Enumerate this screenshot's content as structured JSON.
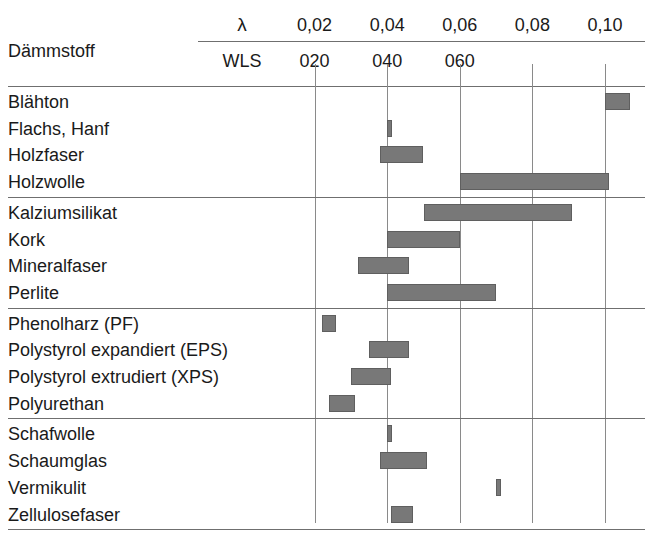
{
  "chart_data": {
    "type": "bar",
    "orientation": "horizontal",
    "title": "",
    "xlabel": "λ",
    "ylabel": "Dämmstoff",
    "row_header_label": "Dämmstoff",
    "axis_top_label": "λ",
    "axis_second_label": "WLS",
    "xlim": [
      0.0,
      0.107
    ],
    "grid": true,
    "legend": "none",
    "lambda_ticks": [
      "0,02",
      "0,04",
      "0,06",
      "0,08",
      "0,10"
    ],
    "lambda_tick_values": [
      0.02,
      0.04,
      0.06,
      0.08,
      0.1
    ],
    "wls_ticks": [
      "020",
      "040",
      "060"
    ],
    "wls_tick_values": [
      0.02,
      0.04,
      0.06
    ],
    "bar_color": "#787878",
    "grid_color": "#8a8a8a",
    "rule_color": "#6f6f6f",
    "groups": [
      {
        "name": "group-1",
        "rows": [
          {
            "label": "Blähton",
            "low": 0.1,
            "high": 0.107
          },
          {
            "label": "Flachs, Hanf",
            "low": 0.04,
            "high": 0.041
          },
          {
            "label": "Holzfaser",
            "low": 0.038,
            "high": 0.05
          },
          {
            "label": "Holzwolle",
            "low": 0.06,
            "high": 0.101
          }
        ]
      },
      {
        "name": "group-2",
        "rows": [
          {
            "label": "Kalziumsilikat",
            "low": 0.05,
            "high": 0.091
          },
          {
            "label": "Kork",
            "low": 0.04,
            "high": 0.06
          },
          {
            "label": "Mineralfaser",
            "low": 0.032,
            "high": 0.046
          },
          {
            "label": "Perlite",
            "low": 0.04,
            "high": 0.07
          }
        ]
      },
      {
        "name": "group-3",
        "rows": [
          {
            "label": "Phenolharz (PF)",
            "low": 0.022,
            "high": 0.026
          },
          {
            "label": "Polystyrol expandiert (EPS)",
            "low": 0.035,
            "high": 0.046
          },
          {
            "label": "Polystyrol extrudiert (XPS)",
            "low": 0.03,
            "high": 0.041
          },
          {
            "label": "Polyurethan",
            "low": 0.024,
            "high": 0.031
          }
        ]
      },
      {
        "name": "group-4",
        "rows": [
          {
            "label": "Schafwolle",
            "low": 0.04,
            "high": 0.041
          },
          {
            "label": "Schaumglas",
            "low": 0.038,
            "high": 0.051
          },
          {
            "label": "Vermikulit",
            "low": 0.07,
            "high": 0.071
          },
          {
            "label": "Zellulosefaser",
            "low": 0.041,
            "high": 0.047
          }
        ]
      }
    ]
  }
}
